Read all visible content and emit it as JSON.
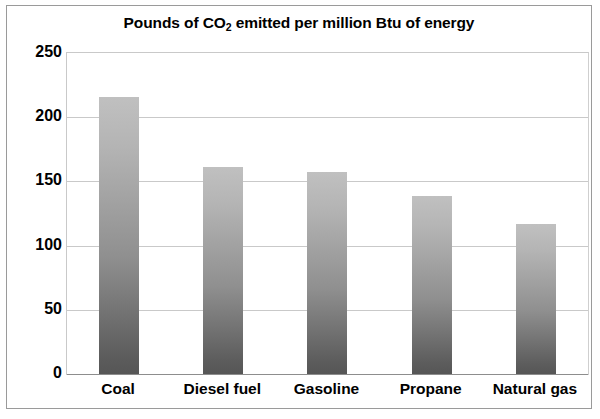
{
  "chart_data": {
    "type": "bar",
    "title": "Pounds of CO2 emitted per million Btu of energy",
    "title_prefix": "Pounds of CO",
    "title_subscript": "2",
    "title_suffix": " emitted per million Btu of energy",
    "categories": [
      "Coal",
      "Diesel fuel",
      "Gasoline",
      "Propane",
      "Natural gas"
    ],
    "values": [
      216,
      161,
      157,
      139,
      117
    ],
    "xlabel": "",
    "ylabel": "",
    "ylim": [
      0,
      250
    ],
    "ytick_labels": [
      "0",
      "50",
      "100",
      "150",
      "200",
      "250"
    ],
    "ytick_values": [
      0,
      50,
      100,
      150,
      200,
      250
    ],
    "grid": true,
    "legend": false,
    "bar_gradient_top": "#c0c0c0",
    "bar_gradient_bottom": "#565656",
    "gridline_color": "#c9c9c9",
    "border_color": "#9a9a9a",
    "background": "#ffffff"
  }
}
